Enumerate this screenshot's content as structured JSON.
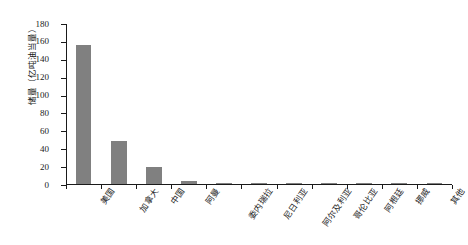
{
  "chart_data": {
    "type": "bar",
    "title": "",
    "subtitle": "",
    "xlabel": "",
    "ylabel": "储量（亿吨油当量）",
    "categories": [
      "美国",
      "加拿大",
      "中国",
      "阿曼",
      "委内瑞拉",
      "尼日利亚",
      "阿尔及利亚",
      "哥伦比亚",
      "阿根廷",
      "挪威",
      "其他"
    ],
    "values": [
      155,
      48,
      19,
      3,
      1.5,
      1.2,
      1.2,
      1.0,
      0.9,
      0.4,
      0.3
    ],
    "ylim": [
      0,
      180
    ],
    "ytick_values": [
      0,
      20,
      40,
      60,
      80,
      100,
      120,
      140,
      160,
      180
    ],
    "ytick_labels": [
      "0",
      "20",
      "40",
      "60",
      "80",
      "100",
      "120",
      "140",
      "160",
      "180"
    ],
    "grid": false,
    "legend": null,
    "bar_color": "#808080",
    "axis_color": "#1a1a1a",
    "background_color": "#ffffff"
  }
}
